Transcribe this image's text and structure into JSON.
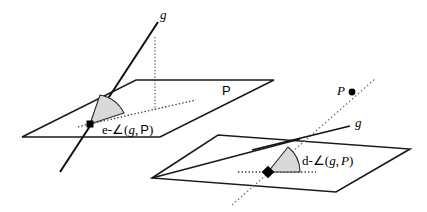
{
  "figure": {
    "title_alt": "Euclidean and discrete angle between a line g and a plane P",
    "background_color": "#ffffff",
    "stroke_color": "#1a1a1a",
    "wedge_fill_color": "#d9d9d9",
    "wedge_stroke_color": "#2b2b2b",
    "dotted_color": "#555555"
  },
  "left_figure": {
    "name": "euclidean-angle-figure",
    "line_label": "g",
    "plane_label": "P",
    "angle_label": {
      "prefix": "e-",
      "symbol": "∠",
      "open_paren": "(",
      "line_arg": "g",
      "comma": ",",
      "plane_arg": "P",
      "close_paren": ")",
      "full": "e-∠(g, P)"
    },
    "vertex_marker": "square-dot"
  },
  "right_figure": {
    "name": "discrete-angle-figure",
    "line_label": "g",
    "point_label": "P",
    "angle_label": {
      "prefix": "d-",
      "symbol": "∠",
      "open_paren": "(",
      "line_arg": "g",
      "comma": ",",
      "plane_arg": "P",
      "close_paren": ")",
      "full": "d-∠(g, P)"
    },
    "vertex_marker": "diamond-dot"
  }
}
